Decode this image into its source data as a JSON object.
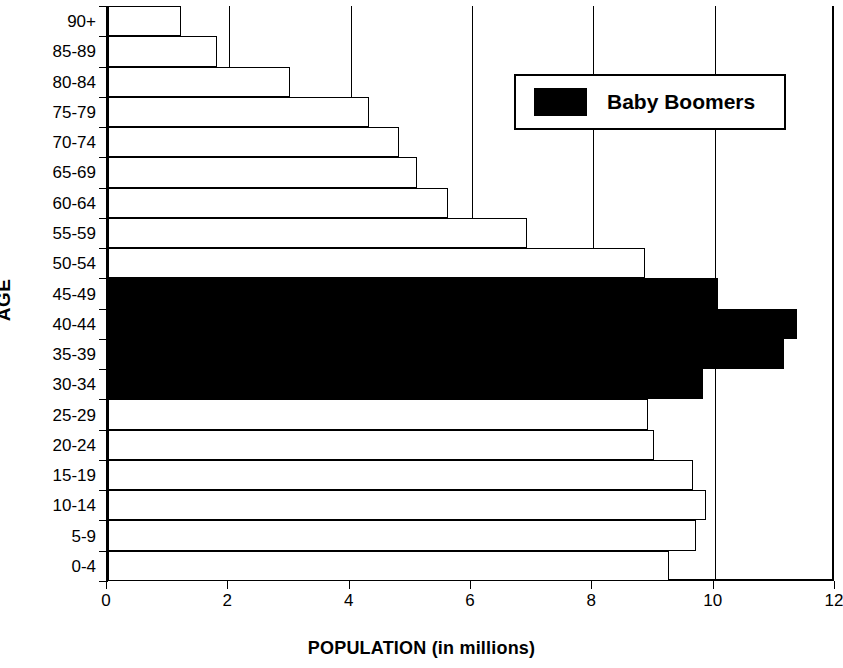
{
  "chart_data": {
    "type": "bar",
    "orientation": "horizontal",
    "title": "",
    "xlabel": "POPULATION (in millions)",
    "ylabel": "AGE",
    "xlim": [
      0,
      12
    ],
    "ylim": null,
    "xticks": [
      "0",
      "2",
      "4",
      "6",
      "8",
      "10",
      "12"
    ],
    "xtick_values": [
      0,
      2,
      4,
      6,
      8,
      10,
      12
    ],
    "grid": "vertical",
    "legend": {
      "position": "top-right",
      "entries": [
        {
          "label": "Baby Boomers",
          "color": "#000000",
          "swatch": "filled-black-rectangle"
        }
      ]
    },
    "categories": [
      "90+",
      "85-89",
      "80-84",
      "75-79",
      "70-74",
      "65-69",
      "60-64",
      "55-59",
      "50-54",
      "45-49",
      "40-44",
      "35-39",
      "30-34",
      "25-29",
      "20-24",
      "15-19",
      "10-14",
      "5-9",
      "0-4"
    ],
    "values": [
      1.2,
      1.8,
      3.0,
      4.3,
      4.8,
      5.1,
      5.6,
      6.9,
      8.85,
      10.05,
      11.35,
      11.15,
      9.8,
      8.9,
      9.0,
      9.65,
      9.85,
      9.7,
      9.25
    ],
    "highlighted_categories": [
      "45-49",
      "40-44",
      "35-39",
      "30-34"
    ],
    "series": [
      {
        "name": "Population",
        "values": [
          1.2,
          1.8,
          3.0,
          4.3,
          4.8,
          5.1,
          5.6,
          6.9,
          8.85,
          10.05,
          11.35,
          11.15,
          9.8,
          8.9,
          9.0,
          9.65,
          9.85,
          9.7,
          9.25
        ]
      }
    ],
    "bar_fill_default": "#ffffff",
    "bar_fill_highlight": "#000000",
    "bar_edge_color": "#000000"
  },
  "axes": {
    "x_title": "POPULATION (in millions)",
    "y_title": "AGE"
  },
  "legend": {
    "label": "Baby Boomers"
  }
}
